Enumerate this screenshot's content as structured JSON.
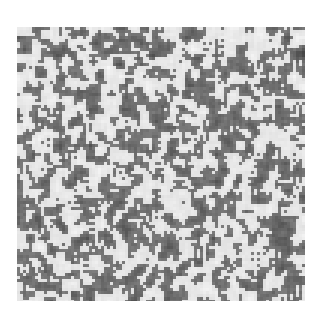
{
  "image": {
    "description": "Grayscale random speckle texture square on white background",
    "background_color": "#ffffff",
    "texture": {
      "x": 17,
      "y": 27,
      "width": 288,
      "height": 274,
      "dark_color": "#2e2e2e",
      "light_color": "#f4f4f4",
      "density": 0.5,
      "grain_size": 3,
      "seed": 7
    }
  }
}
